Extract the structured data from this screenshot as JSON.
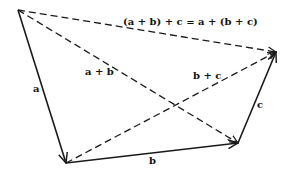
{
  "diagram": {
    "equation": "(a + b) + c = a + (b + c)",
    "colors": {
      "line": "#1a1a1a",
      "background": "#ffffff"
    },
    "points": {
      "origin": [
        18,
        10
      ],
      "after_a": [
        66,
        163
      ],
      "after_b": [
        238,
        143
      ],
      "after_c": [
        276,
        52
      ]
    },
    "vectors": [
      {
        "id": "a",
        "label": "a",
        "from": "origin",
        "to": "after_a",
        "style": "solid"
      },
      {
        "id": "b",
        "label": "b",
        "from": "after_a",
        "to": "after_b",
        "style": "solid"
      },
      {
        "id": "c",
        "label": "c",
        "from": "after_b",
        "to": "after_c",
        "style": "solid"
      },
      {
        "id": "a_plus_b",
        "label": "a + b",
        "from": "origin",
        "to": "after_b",
        "style": "dashed"
      },
      {
        "id": "b_plus_c",
        "label": "b + c",
        "from": "after_a",
        "to": "after_c",
        "style": "dashed"
      },
      {
        "id": "sum",
        "label": "(a + b) + c = a + (b + c)",
        "from": "origin",
        "to": "after_c",
        "style": "dashed"
      }
    ],
    "labels": {
      "a": "a",
      "b": "b",
      "c": "c",
      "a_plus_b": "a + b",
      "b_plus_c": "b + c",
      "equation": "(a + b) + c = a + (b + c)"
    }
  }
}
